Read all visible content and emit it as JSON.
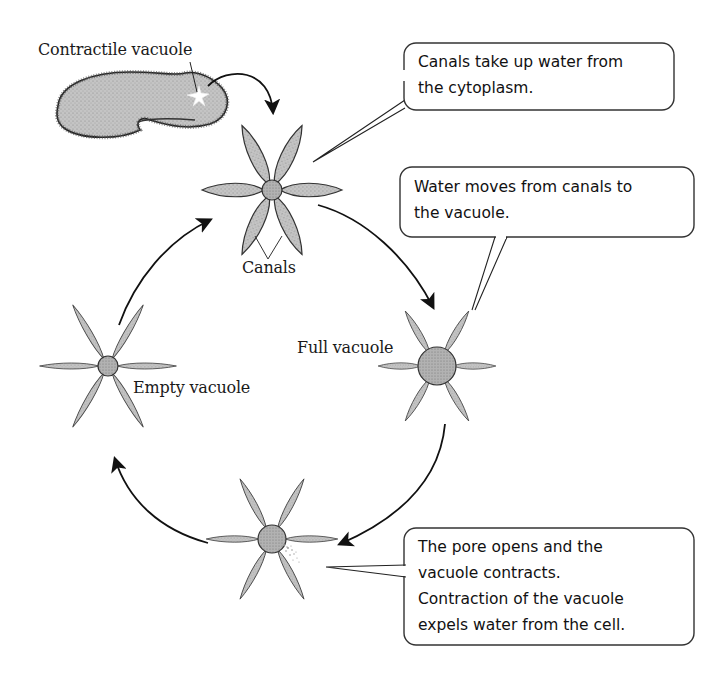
{
  "diagram": {
    "type": "cycle",
    "colors": {
      "stroke": "#111111",
      "cell_fill": "#bdbdbd",
      "canal_fill": "#a9a9a9",
      "vacuole_fill": "#b0b0b0",
      "background": "#ffffff"
    },
    "labels": {
      "contractile_vacuole": "Contractile vacuole",
      "canals": "Canals",
      "full_vacuole": "Full vacuole",
      "empty_vacuole": "Empty vacuole"
    },
    "callouts": [
      {
        "id": "canals-take-up-water",
        "lines": [
          "Canals take up water from",
          "the cytoplasm."
        ]
      },
      {
        "id": "water-moves",
        "lines": [
          "Water moves from canals to",
          "the vacuole."
        ]
      },
      {
        "id": "pore-opens",
        "lines": [
          "The pore opens and the",
          "vacuole contracts.",
          "Contraction of the vacuole",
          "expels water from the cell."
        ]
      }
    ],
    "stages": [
      {
        "name": "top",
        "description": "Canals filling"
      },
      {
        "name": "right",
        "label_key": "full_vacuole"
      },
      {
        "name": "bottom",
        "description": "Pore opens, vacuole contracts"
      },
      {
        "name": "left",
        "label_key": "empty_vacuole"
      }
    ]
  }
}
